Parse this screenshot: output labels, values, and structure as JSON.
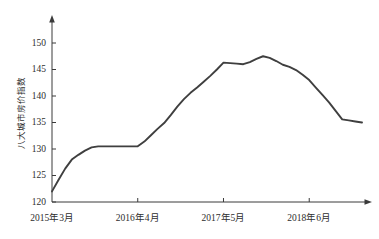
{
  "chart_data": {
    "type": "line",
    "title": "",
    "subtitle": "",
    "xlabel": "",
    "ylabel": "八大城市房价指数",
    "ylim": [
      120,
      152
    ],
    "yticks": [
      120,
      125,
      130,
      135,
      140,
      145,
      150
    ],
    "ytick_labels": [
      "120",
      "125",
      "130",
      "135",
      "140",
      "145",
      "150"
    ],
    "xtick_labels": [
      "2015年3月",
      "2016年4月",
      "2017年5月",
      "2018年6月"
    ],
    "xtick_index": [
      0,
      13,
      26,
      39
    ],
    "grid": false,
    "legend": false,
    "legend_position": "none",
    "axis_arrows": true,
    "line_color": "#3f3f3f",
    "axis_color": "#3a3a3a",
    "x": [
      0,
      1,
      2,
      3,
      4,
      5,
      6,
      7,
      8,
      9,
      10,
      11,
      12,
      13,
      14,
      15,
      16,
      17,
      18,
      19,
      20,
      21,
      22,
      23,
      24,
      25,
      26,
      27,
      28,
      29,
      30,
      31,
      32,
      33,
      34,
      35,
      36,
      37,
      38,
      39,
      40,
      41,
      42,
      43,
      44,
      45,
      46,
      47
    ],
    "values": [
      122.0,
      124.2,
      126.3,
      128.0,
      128.9,
      129.7,
      130.3,
      130.5,
      130.5,
      130.5,
      130.5,
      130.5,
      130.5,
      130.5,
      131.4,
      132.6,
      133.8,
      134.9,
      136.4,
      138.0,
      139.4,
      140.6,
      141.6,
      142.7,
      143.8,
      145.0,
      146.3,
      146.2,
      146.1,
      146.0,
      146.4,
      147.0,
      147.5,
      147.2,
      146.6,
      145.9,
      145.5,
      144.9,
      144.0,
      143.0,
      141.6,
      140.2,
      138.8,
      137.2,
      135.6,
      135.4,
      135.2,
      135.0
    ],
    "series": [
      {
        "name": "八大城市房价指数",
        "values": [
          122.0,
          124.2,
          126.3,
          128.0,
          128.9,
          129.7,
          130.3,
          130.5,
          130.5,
          130.5,
          130.5,
          130.5,
          130.5,
          130.5,
          131.4,
          132.6,
          133.8,
          134.9,
          136.4,
          138.0,
          139.4,
          140.6,
          141.6,
          142.7,
          143.8,
          145.0,
          146.3,
          146.2,
          146.1,
          146.0,
          146.4,
          147.0,
          147.5,
          147.2,
          146.6,
          145.9,
          145.5,
          144.9,
          144.0,
          143.0,
          141.6,
          140.2,
          138.8,
          137.2,
          135.6,
          135.4,
          135.2,
          135.0
        ]
      }
    ],
    "annotations": []
  }
}
